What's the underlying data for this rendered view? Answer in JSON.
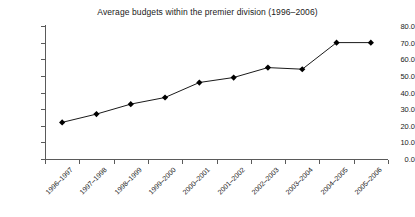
{
  "chart_data": {
    "type": "line",
    "title": "Average budgets within the premier division (1996–2006)",
    "xlabel": "",
    "ylabel": "",
    "categories": [
      "1996–1997",
      "1997–1998",
      "1998–1999",
      "1999–2000",
      "2000–2001",
      "2001–2002",
      "2002–2003",
      "2003–2004",
      "2004–2005",
      "2005–2006"
    ],
    "values": [
      22.0,
      27.0,
      33.0,
      37.0,
      46.0,
      49.0,
      55.0,
      54.0,
      70.0,
      70.0
    ],
    "series": [
      {
        "name": "Average budget",
        "values": [
          22.0,
          27.0,
          33.0,
          37.0,
          46.0,
          49.0,
          55.0,
          54.0,
          70.0,
          70.0
        ]
      }
    ],
    "ylim": [
      0.0,
      80.0
    ],
    "ytick_values": [
      0.0,
      10.0,
      20.0,
      30.0,
      40.0,
      50.0,
      60.0,
      70.0,
      80.0
    ],
    "ytick_labels": [
      "0.0",
      "10.0",
      "20.0",
      "30.0",
      "40.0",
      "50.0",
      "60.0",
      "70.0",
      "80.0"
    ],
    "grid": false,
    "legend": false,
    "legend_position": "none",
    "marker": "diamond",
    "line_color": "#1a1a1a",
    "marker_color": "#000000",
    "background_color": "#ffffff",
    "axis_color": "#5a5a5a"
  }
}
